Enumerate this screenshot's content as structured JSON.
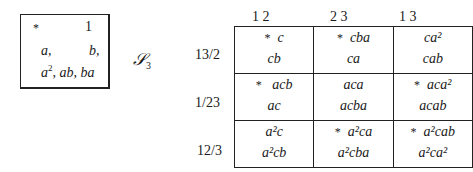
{
  "left_box": {
    "row1": {
      "star": "*",
      "one": "1"
    },
    "row2": {
      "a": "a,",
      "b": "b,"
    },
    "row3": {
      "a2": "a",
      "a2_exp": "2",
      "rest": ", ab, ba"
    }
  },
  "script_label": {
    "symbol": "𝒮",
    "subscript": "3"
  },
  "table": {
    "column_headers": [
      "1  2",
      "2  3",
      "1  3"
    ],
    "row_labels": [
      "13/2",
      "1/23",
      "12/3"
    ],
    "cells": [
      [
        {
          "star": "*",
          "top": "c",
          "bottom": "cb"
        },
        {
          "star": "*",
          "top": "cba",
          "bottom": "ca"
        },
        {
          "star": "",
          "top": "ca²",
          "bottom": "cab"
        }
      ],
      [
        {
          "star": "*",
          "top": "acb",
          "bottom": "ac"
        },
        {
          "star": "",
          "top": "aca",
          "bottom": "acba"
        },
        {
          "star": "*",
          "top": "aca²",
          "bottom": "acab"
        }
      ],
      [
        {
          "star": "",
          "top": "a²c",
          "bottom": "a²cb"
        },
        {
          "star": "*",
          "top": "a²ca",
          "bottom": "a²cba"
        },
        {
          "star": "*",
          "top": "a²cab",
          "bottom": "a²ca²"
        }
      ]
    ]
  }
}
